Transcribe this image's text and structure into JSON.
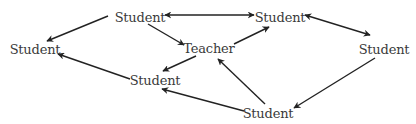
{
  "diagram": {
    "title": "",
    "line_color": "#222222",
    "text_color": "#3a3a3a",
    "nodes": [
      {
        "id": "s1",
        "label": "Student",
        "x": 140,
        "y": 17
      },
      {
        "id": "s2",
        "label": "Student",
        "x": 280,
        "y": 17
      },
      {
        "id": "s3",
        "label": "Student",
        "x": 35,
        "y": 49
      },
      {
        "id": "teacher",
        "label": "Teacher",
        "x": 209,
        "y": 48
      },
      {
        "id": "s4",
        "label": "Student",
        "x": 384,
        "y": 49
      },
      {
        "id": "s5",
        "label": "Student",
        "x": 155,
        "y": 80
      },
      {
        "id": "s6",
        "label": "Student",
        "x": 268,
        "y": 113
      }
    ],
    "edges": [
      {
        "from": "s1",
        "to": "s3",
        "direction": "forward",
        "x1": 108,
        "y1": 16,
        "x2": 47,
        "y2": 41
      },
      {
        "from": "s1",
        "to": "s2",
        "direction": "both",
        "x1": 165,
        "y1": 15,
        "x2": 254,
        "y2": 15
      },
      {
        "from": "s1",
        "to": "teacher",
        "direction": "forward",
        "x1": 148,
        "y1": 24,
        "x2": 184,
        "y2": 45
      },
      {
        "from": "teacher",
        "to": "s2",
        "direction": "forward",
        "x1": 234,
        "y1": 44,
        "x2": 269,
        "y2": 27
      },
      {
        "from": "teacher",
        "to": "s5",
        "direction": "forward",
        "x1": 196,
        "y1": 56,
        "x2": 163,
        "y2": 71
      },
      {
        "from": "s2",
        "to": "s4",
        "direction": "both",
        "x1": 305,
        "y1": 15,
        "x2": 370,
        "y2": 35
      },
      {
        "from": "s5",
        "to": "s3",
        "direction": "forward",
        "x1": 130,
        "y1": 79,
        "x2": 58,
        "y2": 54
      },
      {
        "from": "s6",
        "to": "teacher",
        "direction": "forward",
        "x1": 265,
        "y1": 104,
        "x2": 218,
        "y2": 59
      },
      {
        "from": "s6",
        "to": "s5",
        "direction": "forward",
        "x1": 244,
        "y1": 111,
        "x2": 162,
        "y2": 89
      },
      {
        "from": "s4",
        "to": "s6",
        "direction": "forward",
        "x1": 375,
        "y1": 58,
        "x2": 294,
        "y2": 108
      }
    ]
  }
}
